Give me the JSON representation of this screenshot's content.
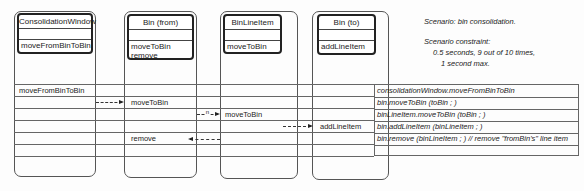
{
  "classes": [
    {
      "name": "ConsolidationWindow",
      "operations": [
        "moveFromBinToBin"
      ]
    },
    {
      "name": "Bin (from)",
      "operations": [
        "moveToBin",
        "remove"
      ]
    },
    {
      "name": "BinLineItem",
      "operations": [
        "moveToBin"
      ]
    },
    {
      "name": "Bin (to)",
      "operations": [
        "addLineItem"
      ]
    }
  ],
  "notes": {
    "scenario": "Scenario:  bin consolidation.",
    "constraint_title": "Scenario constraint:",
    "constraint_line1": "0.5 seconds, 9 out of 10 times,",
    "constraint_line2": "1 second max."
  },
  "messages": [
    {
      "column": "ConsolidationWindow",
      "label": "moveFromBinToBin",
      "script": "consolidationWindow.moveFromBinToBin"
    },
    {
      "column": "Bin (from)",
      "label": "moveToBin",
      "script": "bin.moveToBin (toBin ; )"
    },
    {
      "column": "BinLineItem",
      "label": "moveToBin",
      "script": "binLineItem.moveToBin (toBin ; )",
      "multiplicity": "n"
    },
    {
      "column": "Bin (to)",
      "label": "addLineItem",
      "script": "bin.addLineItem (binLineItem ; )"
    },
    {
      "column": "Bin (from)",
      "label": "remove",
      "script": "bin.remove (binLineItem ; ) // remove \"fromBin's\" line item"
    }
  ]
}
